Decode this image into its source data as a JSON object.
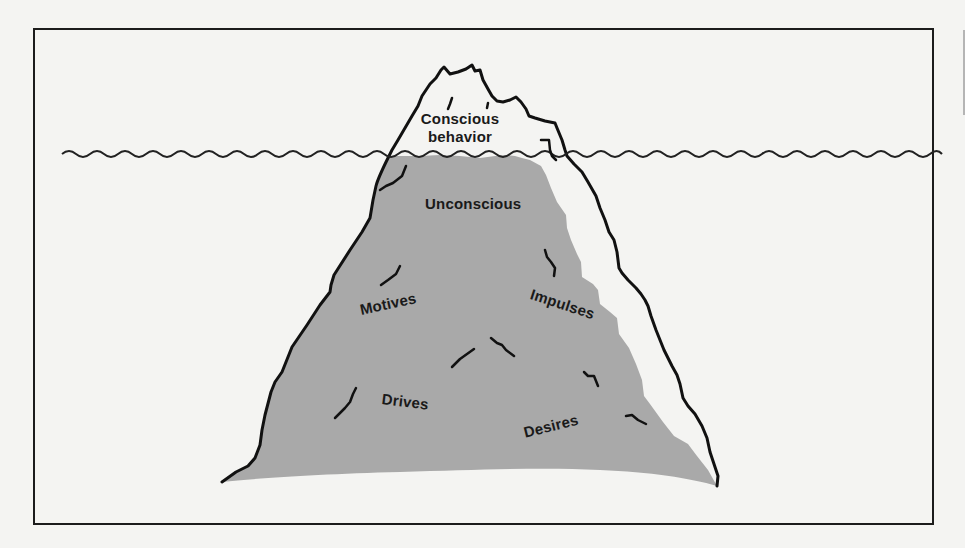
{
  "figure": {
    "colors": {
      "background": "#f4f4f2",
      "frame": "#1c1c1c",
      "outline": "#111111",
      "submerged_fill": "#a9a9a9",
      "water_line": "#222222"
    },
    "labels": {
      "above_water": "Conscious behavior",
      "above_water_line1": "Conscious",
      "above_water_line2": "behavior",
      "below_water_main": "Unconscious",
      "motives": "Motives",
      "impulses": "Impulses",
      "drives": "Drives",
      "desires": "Desires"
    }
  }
}
